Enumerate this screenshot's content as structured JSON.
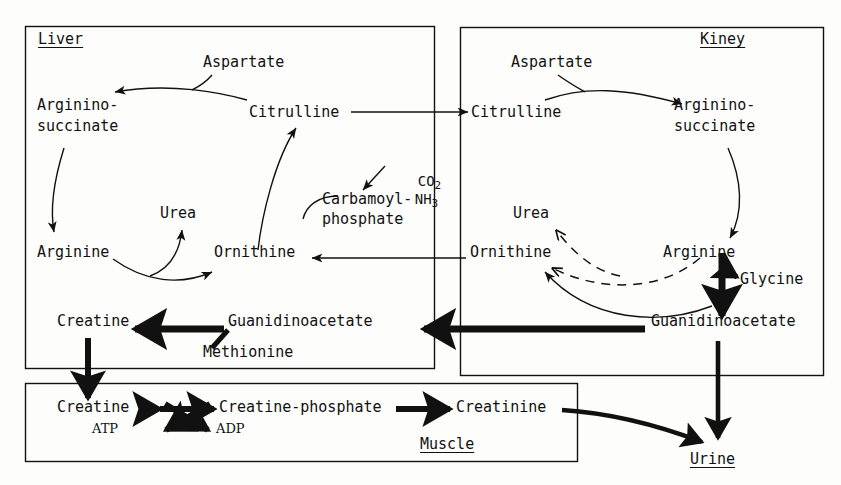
{
  "diagram": {
    "type": "biochemical-pathway",
    "stroke_color": "#111111",
    "background_color": "#fdfdfb"
  },
  "compartments": {
    "liver": {
      "label": "Liver"
    },
    "kidney": {
      "label": "Kiney"
    },
    "muscle": {
      "label": "Muscle"
    }
  },
  "liver": {
    "aspartate": "Aspartate",
    "argininosuccinate_line1": "Arginino-",
    "argininosuccinate_line2": "succinate",
    "citrulline": "Citrulline",
    "co2": "CO",
    "co2_sub": "2",
    "nh3": "NH",
    "nh3_sub": "3",
    "carbamoyl_line1": "Carbamoyl-",
    "carbamoyl_line2": "phosphate",
    "urea": "Urea",
    "arginine": "Arginine",
    "ornithine": "Ornithine",
    "creatine": "Creatine",
    "guanidinoacetate": "Guanidinoacetate",
    "methionine": "Methionine"
  },
  "kidney": {
    "aspartate": "Aspartate",
    "citrulline": "Citrulline",
    "argininosuccinate_line1": "Arginino-",
    "argininosuccinate_line2": "succinate",
    "urea": "Urea",
    "ornithine": "Ornithine",
    "arginine": "Arginine",
    "glycine": "Glycine",
    "guanidinoacetate": "Guanidinoacetate"
  },
  "muscle": {
    "creatine": "Creatine",
    "atp": "ATP",
    "creatine_phosphate": "Creatine-phosphate",
    "adp": "ADP",
    "creatinine": "Creatinine"
  },
  "excretion": {
    "urine": "Urine"
  }
}
